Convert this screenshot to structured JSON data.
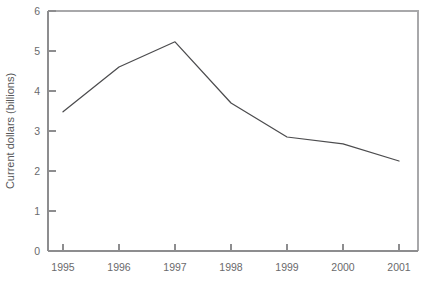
{
  "chart_data": {
    "type": "line",
    "title": "",
    "subtitle": "",
    "xlabel": "",
    "ylabel": "Current dollars (billions)",
    "categories": [
      "1995",
      "1996",
      "1997",
      "1998",
      "1999",
      "2000",
      "2001"
    ],
    "x": [
      1995,
      1996,
      1997,
      1998,
      1999,
      2000,
      2001
    ],
    "values": [
      3.48,
      4.6,
      5.23,
      3.7,
      2.85,
      2.68,
      2.25
    ],
    "series": [
      {
        "name": "Current dollars (billions)",
        "values": [
          3.48,
          4.6,
          5.23,
          3.7,
          2.85,
          2.68,
          2.25
        ]
      }
    ],
    "xlim": [
      1994.6,
      2001.6
    ],
    "ylim": [
      0,
      6
    ],
    "yticks": [
      0,
      1,
      2,
      3,
      4,
      5,
      6
    ],
    "ytick_labels": [
      "0",
      "1",
      "2",
      "3",
      "4",
      "5",
      "6"
    ],
    "xtick_labels": [
      "1995",
      "1996",
      "1997",
      "1998",
      "1999",
      "2000",
      "2001"
    ],
    "grid": false,
    "legend": false,
    "legend_position": "none",
    "line_color": "#4c4c4e",
    "axis_color": "#8d8d8f",
    "frame_color": "#a8a8aa",
    "text_color": "#58585a",
    "background": "#ffffff",
    "markers": false,
    "annotations": []
  }
}
